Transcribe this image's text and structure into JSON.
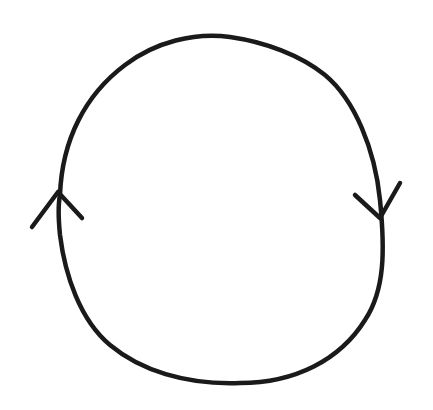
{
  "diagram": {
    "type": "cycle",
    "stroke_color": "#1a1a1a",
    "background_color": "#ffffff",
    "arrows": [
      {
        "position": "left",
        "direction": "up"
      },
      {
        "position": "right",
        "direction": "down"
      }
    ]
  }
}
